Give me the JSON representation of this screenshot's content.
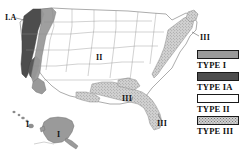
{
  "figure": {
    "kind": "us-zone-map"
  },
  "map_labels": [
    {
      "id": "ia-pacific-northwest",
      "text": "I.A",
      "zone": "TYPE IA"
    },
    {
      "id": "ii-central",
      "text": "II",
      "zone": "TYPE II"
    },
    {
      "id": "iii-southeast",
      "text": "III",
      "zone": "TYPE III"
    },
    {
      "id": "iii-florida",
      "text": "III",
      "zone": "TYPE III"
    },
    {
      "id": "iii-northeast",
      "text": "III",
      "zone": "TYPE III"
    },
    {
      "id": "i-alaska",
      "text": "I",
      "zone": "TYPE I"
    },
    {
      "id": "i-hawaii",
      "text": "I",
      "zone": "TYPE I"
    }
  ],
  "legend": {
    "items": [
      {
        "label": "TYPE I",
        "swatch": "solid-medium-gray",
        "color": "#9a9a9a"
      },
      {
        "label": "TYPE IA",
        "swatch": "solid-dark-gray",
        "color": "#4d4d4d"
      },
      {
        "label": "TYPE II",
        "swatch": "white",
        "color": "#ffffff"
      },
      {
        "label": "TYPE III",
        "swatch": "stippled-light-gray",
        "color": "#cfcfcf"
      }
    ]
  },
  "colors": {
    "outline": "#555555",
    "border": "#1a1a1a",
    "type_i": "#9a9a9a",
    "type_ia": "#4d4d4d",
    "type_ii": "#ffffff",
    "type_iii": "#cfcfcf",
    "background": "#ffffff"
  }
}
